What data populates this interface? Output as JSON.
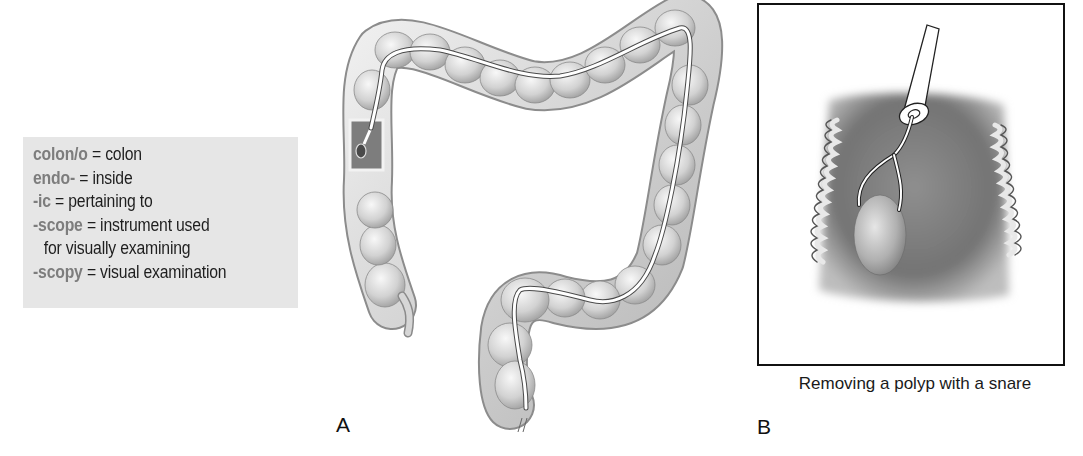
{
  "term_box": {
    "background": "#e6e6e6",
    "term_color": "#7d7d7d",
    "entries": [
      {
        "term": "colon/o",
        "definition": " = colon"
      },
      {
        "term": "endo-",
        "definition": " = inside"
      },
      {
        "term": "-ic",
        "definition": " = pertaining to"
      },
      {
        "term": "-scope",
        "definition": " = instrument used"
      },
      {
        "term": "",
        "definition": "for visually examining"
      },
      {
        "term": "-scopy",
        "definition": " = visual examination"
      }
    ]
  },
  "figure_a": {
    "label": "A",
    "subject": "colonoscope-in-large-intestine"
  },
  "figure_b": {
    "label": "B",
    "caption": "Removing a polyp with a snare",
    "subject": "polyp-snare-closeup"
  }
}
